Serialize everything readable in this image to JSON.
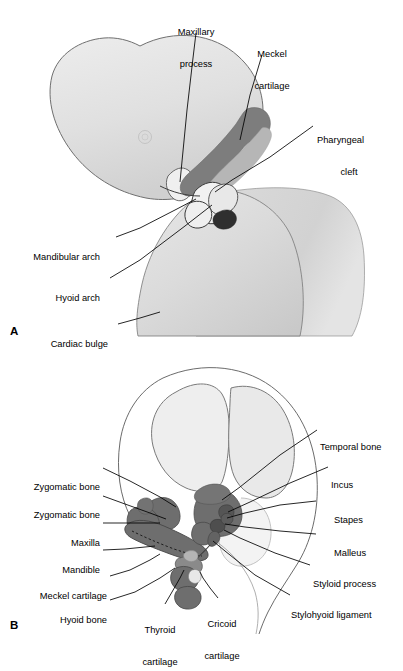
{
  "figure": {
    "panels": [
      {
        "id": "A",
        "letter": "A",
        "caption": "Embryonic head showing pharyngeal arches",
        "labels": [
          {
            "name": "maxillary-process",
            "lines": [
              "Maxillary",
              "process"
            ],
            "align": "center",
            "x": 196,
            "y": 8,
            "leader": [
              [
                196,
                33
              ],
              [
                193,
                58
              ],
              [
                187,
                110
              ],
              [
                180,
                182
              ]
            ]
          },
          {
            "name": "meckel-cartilage",
            "lines": [
              "Meckel",
              "cartilage"
            ],
            "align": "center",
            "x": 272,
            "y": 30,
            "leader": [
              [
                262,
                55
              ],
              [
                250,
                95
              ],
              [
                240,
                140
              ]
            ]
          },
          {
            "name": "pharyngeal-cleft",
            "lines": [
              "Pharyngeal",
              "cleft"
            ],
            "align": "left",
            "x": 316,
            "y": 116,
            "leader": [
              [
                313,
                126
              ],
              [
                270,
                157
              ],
              [
                232,
                180
              ],
              [
                215,
                192
              ]
            ]
          },
          {
            "name": "mandibular-arch",
            "lines": [
              "Mandibular arch"
            ],
            "align": "right",
            "x": 30,
            "y": 234,
            "leader": [
              [
                116,
                237
              ],
              [
                140,
                228
              ],
              [
                175,
                210
              ],
              [
                196,
                199
              ]
            ]
          },
          {
            "name": "hyoid-arch",
            "lines": [
              "Hyoid arch"
            ],
            "align": "right",
            "x": 55,
            "y": 275,
            "leader": [
              [
                110,
                278
              ],
              [
                140,
                260
              ],
              [
                185,
                226
              ],
              [
                212,
                205
              ]
            ]
          },
          {
            "name": "cardiac-bulge",
            "lines": [
              "Cardiac bulge"
            ],
            "align": "right",
            "x": 46,
            "y": 321,
            "leader": [
              [
                118,
                324
              ],
              [
                140,
                318
              ],
              [
                160,
                312
              ]
            ]
          }
        ]
      },
      {
        "id": "B",
        "letter": "B",
        "caption": "Fetal skull showing bones and cartilages derived from the arches",
        "labels": [
          {
            "name": "temporal-bone",
            "lines": [
              "Temporal bone"
            ],
            "align": "left",
            "x": 320,
            "y": 425,
            "leader": [
              [
                317,
                430
              ],
              [
                280,
                455
              ],
              [
                240,
                487
              ],
              [
                222,
                500
              ]
            ]
          },
          {
            "name": "incus",
            "lines": [
              "Incus"
            ],
            "align": "left",
            "x": 331,
            "y": 462,
            "leader": [
              [
                328,
                467
              ],
              [
                290,
                483
              ],
              [
                250,
                502
              ],
              [
                228,
                512
              ]
            ]
          },
          {
            "name": "stapes",
            "lines": [
              "Stapes"
            ],
            "align": "left",
            "x": 334,
            "y": 497,
            "leader": [
              [
                316,
                501
              ],
              [
                280,
                505
              ],
              [
                245,
                513
              ],
              [
                227,
                518
              ]
            ]
          },
          {
            "name": "malleus",
            "lines": [
              "Malleus"
            ],
            "align": "left",
            "x": 334,
            "y": 530,
            "leader": [
              [
                316,
                534
              ],
              [
                280,
                531
              ],
              [
                245,
                527
              ],
              [
                225,
                524
              ]
            ]
          },
          {
            "name": "styloid-process",
            "lines": [
              "Styloid process"
            ],
            "align": "left",
            "x": 313,
            "y": 561,
            "leader": [
              [
                310,
                565
              ],
              [
                275,
                553
              ],
              [
                240,
                538
              ],
              [
                224,
                530
              ]
            ]
          },
          {
            "name": "stylohyoid-ligament",
            "lines": [
              "Stylohyoid ligament"
            ],
            "align": "left",
            "x": 293,
            "y": 592,
            "leader": [
              [
                290,
                595
              ],
              [
                255,
                575
              ],
              [
                225,
                551
              ],
              [
                213,
                541
              ]
            ]
          },
          {
            "name": "zygomatic-bone-upper",
            "lines": [
              "Zygomatic bone"
            ],
            "align": "right",
            "x": 32,
            "y": 464,
            "leader": [
              [
                103,
                468
              ],
              [
                130,
                481
              ],
              [
                160,
                497
              ],
              [
                176,
                507
              ]
            ]
          },
          {
            "name": "zygomatic-bone-lower",
            "lines": [
              "Zygomatic bone"
            ],
            "align": "right",
            "x": 32,
            "y": 492,
            "leader": [
              [
                103,
                496
              ],
              [
                125,
                504
              ],
              [
                150,
                513
              ],
              [
                166,
                519
              ]
            ]
          },
          {
            "name": "maxilla",
            "lines": [
              "Maxilla"
            ],
            "align": "right",
            "x": 60,
            "y": 520,
            "leader": [
              [
                103,
                523
              ],
              [
                125,
                523
              ],
              [
                148,
                523
              ],
              [
                160,
                523
              ]
            ]
          },
          {
            "name": "mandible",
            "lines": [
              "Mandible"
            ],
            "align": "right",
            "x": 52,
            "y": 547,
            "leader": [
              [
                103,
                550
              ],
              [
                125,
                549
              ],
              [
                145,
                547
              ],
              [
                155,
                546
              ]
            ]
          },
          {
            "name": "meckel-cartilage-b",
            "lines": [
              "Meckel cartilage"
            ],
            "align": "right",
            "x": 30,
            "y": 573,
            "leader": [
              [
                110,
                576
              ],
              [
                130,
                570
              ],
              [
                150,
                560
              ],
              [
                160,
                554
              ]
            ]
          },
          {
            "name": "hyoid-bone",
            "lines": [
              "Hyoid bone"
            ],
            "align": "right",
            "x": 50,
            "y": 597,
            "leader": [
              [
                110,
                600
              ],
              [
                135,
                592
              ],
              [
                160,
                578
              ],
              [
                175,
                568
              ]
            ]
          },
          {
            "name": "thyroid-cartilage",
            "lines": [
              "Thyroid",
              "cartilage"
            ],
            "align": "center",
            "x": 160,
            "y": 607,
            "leader": [
              [
                165,
                604
              ],
              [
                172,
                592
              ],
              [
                180,
                578
              ],
              [
                184,
                570
              ]
            ]
          },
          {
            "name": "cricoid-cartilage",
            "lines": [
              "Cricoid",
              "cartilage"
            ],
            "align": "center",
            "x": 222,
            "y": 601,
            "leader": [
              [
                218,
                598
              ],
              [
                210,
                588
              ],
              [
                203,
                578
              ],
              [
                200,
                572
              ]
            ]
          }
        ]
      }
    ]
  },
  "colors": {
    "outline": "#1a1a1a",
    "embryo_fill_light": "#e2e2e2",
    "embryo_fill_mid": "#d4d4d4",
    "embryo_fill_shadow": "#c4c4c4",
    "cartilage_dark": "#808080",
    "cartilage_mid": "#a0a0a0",
    "bone_dark": "#6e6e6e",
    "bone_outline_fill": "#f0f0f0",
    "cranial_fill": "#ececec",
    "near_black": "#2b2b2b",
    "background": "#ffffff",
    "text": "#000000"
  }
}
